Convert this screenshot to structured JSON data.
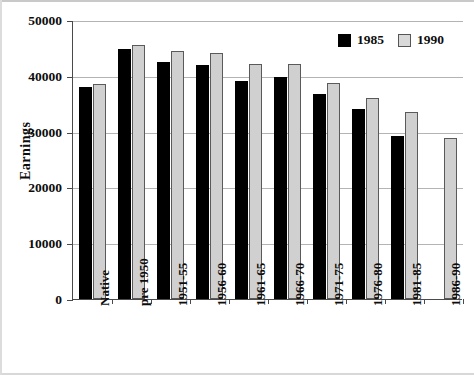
{
  "chart_data": {
    "type": "bar",
    "title": "",
    "xlabel": "",
    "ylabel": "Earnings",
    "ylim": [
      0,
      50000
    ],
    "ytick_labels": [
      "50000",
      "40000",
      "30000",
      "20000",
      "10000",
      "0"
    ],
    "ytick_values": [
      50000,
      40000,
      30000,
      20000,
      10000,
      0
    ],
    "grid": true,
    "legend_position": "top-right",
    "categories": [
      "Native",
      "pre 1950",
      "1951-55",
      "1956-60",
      "1961-65",
      "1966-70",
      "1971-75",
      "1976-80",
      "1981-85",
      "1986-90"
    ],
    "series": [
      {
        "name": "1985",
        "color": "#000000",
        "values": [
          38000,
          44800,
          42500,
          42000,
          39000,
          39800,
          36800,
          34000,
          29300,
          null
        ]
      },
      {
        "name": "1990",
        "color": "#d0d0d0",
        "values": [
          38500,
          45500,
          44500,
          44000,
          42200,
          42200,
          38800,
          36000,
          33500,
          28800
        ]
      }
    ]
  },
  "legend": {
    "entries": [
      {
        "label": "1985"
      },
      {
        "label": "1990"
      }
    ]
  },
  "axis": {
    "y_title": "Earnings"
  }
}
